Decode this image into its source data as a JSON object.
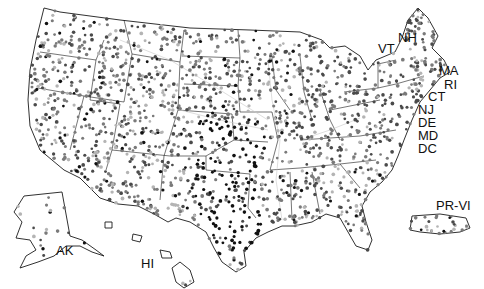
{
  "map": {
    "title": "",
    "style": "grayscale dot-density",
    "colors": {
      "background": "#ffffff",
      "outline": "#1a1a1a",
      "dot_light": "#b4b4b4",
      "dot_mid": "#7a7a7a",
      "dot_dark": "#4a4a4a",
      "dot_black": "#111111",
      "river": "#c8c8c8"
    },
    "labels": [
      {
        "id": "nh",
        "text": "NH"
      },
      {
        "id": "vt",
        "text": "VT"
      },
      {
        "id": "ma",
        "text": "MA"
      },
      {
        "id": "ri",
        "text": "RI"
      },
      {
        "id": "ct",
        "text": "CT"
      },
      {
        "id": "nj",
        "text": "NJ"
      },
      {
        "id": "de",
        "text": "DE"
      },
      {
        "id": "md",
        "text": "MD"
      },
      {
        "id": "dc",
        "text": "DC"
      },
      {
        "id": "ak",
        "text": "AK"
      },
      {
        "id": "hi",
        "text": "HI"
      },
      {
        "id": "pr-vi",
        "text": "PR-VI"
      }
    ],
    "regions": [
      "Contiguous US",
      "Alaska",
      "Hawaii",
      "Puerto Rico and Virgin Islands"
    ]
  }
}
